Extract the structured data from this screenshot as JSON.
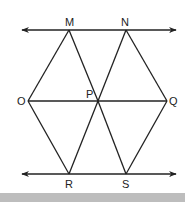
{
  "diagram": {
    "type": "geometry",
    "stroke_color": "#222222",
    "footer_color": "#bdbdbd",
    "lines": [
      {
        "id": "top-line",
        "x1": 22,
        "y1": 30,
        "x2": 176,
        "y2": 30,
        "arrows": "both"
      },
      {
        "id": "bottom-line",
        "x1": 22,
        "y1": 174,
        "x2": 176,
        "y2": 174,
        "arrows": "both"
      },
      {
        "id": "OQ",
        "x1": 28,
        "y1": 101,
        "x2": 167,
        "y2": 101
      }
    ],
    "points": {
      "M": {
        "label": "M",
        "x": 69,
        "y": 30
      },
      "N": {
        "label": "N",
        "x": 126,
        "y": 30
      },
      "O": {
        "label": "O",
        "x": 28,
        "y": 101
      },
      "P": {
        "label": "P",
        "x": 98,
        "y": 101
      },
      "Q": {
        "label": "Q",
        "x": 167,
        "y": 101
      },
      "R": {
        "label": "R",
        "x": 69,
        "y": 174
      },
      "S": {
        "label": "S",
        "x": 126,
        "y": 174
      }
    },
    "segments": [
      [
        "M",
        "O"
      ],
      [
        "M",
        "P"
      ],
      [
        "N",
        "P"
      ],
      [
        "N",
        "Q"
      ],
      [
        "O",
        "R"
      ],
      [
        "P",
        "R"
      ],
      [
        "P",
        "S"
      ],
      [
        "Q",
        "S"
      ]
    ],
    "labels": {
      "M": "M",
      "N": "N",
      "O": "O",
      "P": "P",
      "Q": "Q",
      "R": "R",
      "S": "S"
    }
  }
}
